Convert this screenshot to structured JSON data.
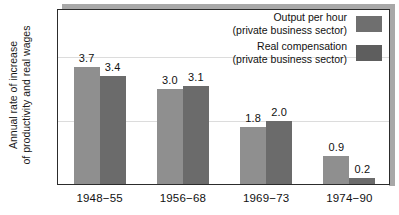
{
  "chart_data": {
    "type": "bar",
    "title": "",
    "xlabel": "",
    "ylabel": "Annual rate of increase of productivity and real wages",
    "ylabel_line1": "Annual rate of increase",
    "ylabel_line2": "of productivity and real wages",
    "categories": [
      "1948−55",
      "1956−68",
      "1969−73",
      "1974−90"
    ],
    "series": [
      {
        "name": "Output per hour",
        "sublabel": "(private business sector)",
        "color": "#8f8f8f",
        "values": [
          3.7,
          3.0,
          1.8,
          0.9
        ],
        "labels": [
          "3.7",
          "3.0",
          "1.8",
          "0.9"
        ]
      },
      {
        "name": "Real compensation",
        "sublabel": "(private business sector)",
        "color": "#6b6b6b",
        "values": [
          3.4,
          3.1,
          2.0,
          0.2
        ],
        "labels": [
          "3.4",
          "3.1",
          "2.0",
          "0.2"
        ]
      }
    ],
    "ylim": [
      0,
      5.5
    ],
    "yticks": [
      2.0,
      4.0
    ],
    "ytick_labels": [
      "2.0",
      "4.0"
    ],
    "grid": true,
    "legend_position": "top-right"
  },
  "legend": {
    "entries": [
      {
        "line1": "Output per hour",
        "line2": "(private business sector)",
        "swatch_color": "#6f6f6f"
      },
      {
        "line1": "Real compensation",
        "line2": "(private business sector)",
        "swatch_color": "#5e5e5e"
      }
    ]
  },
  "colors": {
    "series1": "#8f8f8f",
    "series2": "#6b6b6b",
    "frame": "#2c2c2c",
    "grid": "#dcdcdc",
    "shadow": "#a8a8a8",
    "text": "#111111",
    "background": "#ffffff"
  }
}
